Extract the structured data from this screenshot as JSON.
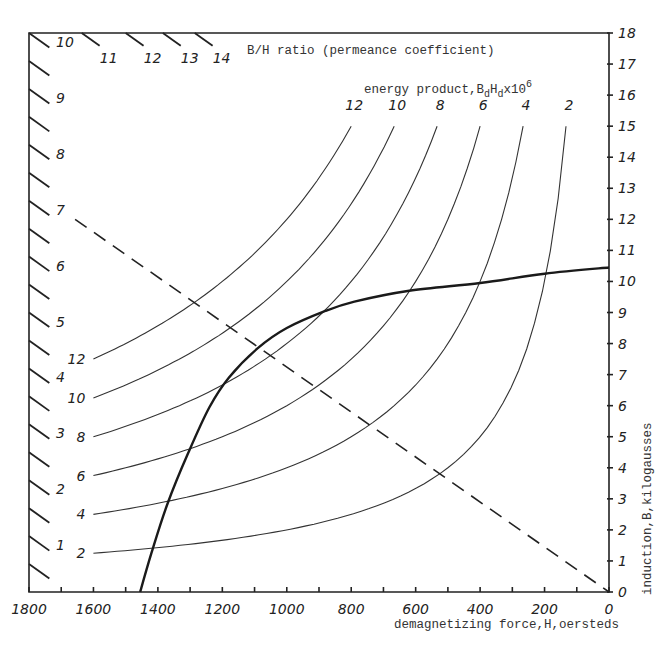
{
  "chart_data": {
    "type": "line",
    "title": "",
    "xlabel": "demagnetizing force,H,oersteds",
    "ylabel": "induction,B,kilogausses",
    "x_direction": "reversed",
    "xlim": [
      1800,
      0
    ],
    "ylim": [
      0,
      18
    ],
    "x_ticks": [
      1800,
      1600,
      1400,
      1200,
      1000,
      800,
      600,
      400,
      200,
      0
    ],
    "x_minor_step": 100,
    "y_ticks": [
      0,
      1,
      2,
      3,
      4,
      5,
      6,
      7,
      8,
      9,
      10,
      11,
      12,
      13,
      14,
      15,
      16,
      17,
      18
    ],
    "y_axis_position": "right",
    "grid": false,
    "permeance_scale": {
      "label": "B/H ratio (permeance coefficient)",
      "left_edge_labels": [
        1,
        2,
        3,
        4,
        5,
        6,
        7,
        8,
        9,
        10
      ],
      "top_edge_labels": [
        10,
        11,
        12,
        13,
        14
      ],
      "half_steps_on_left_edge": true
    },
    "energy_product": {
      "label": "energy product,B",
      "label_sub1": "d",
      "label_mid": "H",
      "label_sub2": "d",
      "label_tail": "x10",
      "label_sup": "6",
      "unit_multiplier": 1000000,
      "curves": [
        {
          "value": 2,
          "label": "2",
          "h_start": 1600,
          "b_end": 15
        },
        {
          "value": 4,
          "label": "4",
          "h_start": 1600,
          "b_end": 15
        },
        {
          "value": 6,
          "label": "6",
          "h_start": 1600,
          "b_end": 15
        },
        {
          "value": 8,
          "label": "8",
          "h_start": 1600,
          "b_end": 15
        },
        {
          "value": 10,
          "label": "10",
          "h_start": 1600,
          "b_end": 15
        },
        {
          "value": 12,
          "label": "12",
          "h_start": 1600,
          "b_end": 15
        }
      ]
    },
    "series": [
      {
        "name": "demagnetization curve",
        "style": "solid-bold",
        "points": [
          [
            1455,
            0.0
          ],
          [
            1420,
            1.25
          ],
          [
            1370,
            2.85
          ],
          [
            1305,
            4.5
          ],
          [
            1240,
            5.95
          ],
          [
            1180,
            6.9
          ],
          [
            1090,
            7.85
          ],
          [
            1000,
            8.5
          ],
          [
            880,
            9.05
          ],
          [
            790,
            9.35
          ],
          [
            620,
            9.7
          ],
          [
            400,
            9.95
          ],
          [
            200,
            10.25
          ],
          [
            0,
            10.45
          ]
        ]
      },
      {
        "name": "load line (B/H = 7)",
        "style": "dashed",
        "points": [
          [
            1657,
            12.0
          ],
          [
            0,
            0
          ]
        ]
      }
    ]
  }
}
